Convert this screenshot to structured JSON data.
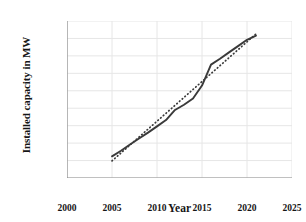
{
  "chart_data": {
    "type": "line",
    "title": "",
    "xlabel": "Year",
    "ylabel": "Installed capacity in MW",
    "xlim": [
      2000,
      2025
    ],
    "ylim": [
      0,
      45000
    ],
    "xticks": [
      "2000",
      "2005",
      "2010",
      "2015",
      "2020",
      "2025"
    ],
    "xtick_values": [
      2000,
      2005,
      2010,
      2015,
      2020,
      2025
    ],
    "yticks": [
      "0",
      "5,000",
      "10,000",
      "15,000",
      "20,000",
      "25,000",
      "30,000",
      "35,000",
      "40,000",
      "45,000"
    ],
    "ytick_values": [
      0,
      5000,
      10000,
      15000,
      20000,
      25000,
      30000,
      35000,
      40000,
      45000
    ],
    "grid": true,
    "legend": "none",
    "series": [
      {
        "name": "Installed capacity",
        "style": "solid",
        "color": "#3a3a3a",
        "x": [
          2005,
          2006,
          2007,
          2008,
          2009,
          2010,
          2011,
          2012,
          2013,
          2014,
          2015,
          2016,
          2017,
          2018,
          2019,
          2020,
          2021
        ],
        "values": [
          6200,
          7800,
          9600,
          11300,
          13000,
          14800,
          16600,
          19500,
          21000,
          22800,
          26500,
          32500,
          34200,
          36000,
          37800,
          39600,
          40800
        ]
      },
      {
        "name": "Linear trendline",
        "style": "dotted",
        "color": "#3a3a3a",
        "x": [
          2005,
          2021
        ],
        "values": [
          4900,
          41300
        ]
      }
    ]
  },
  "axes": {
    "y_title": "Installed capacity in MW",
    "x_title": "Year"
  }
}
